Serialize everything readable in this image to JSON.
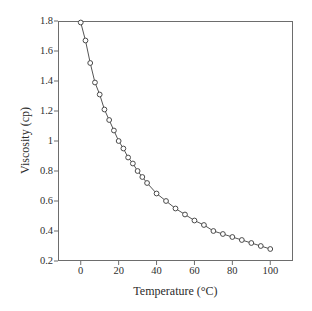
{
  "chart_data": {
    "type": "line",
    "title": "",
    "xlabel": "Temperature (°C)",
    "ylabel": "Viscosity (cp)",
    "xlim": [
      -12,
      112
    ],
    "ylim": [
      0.2,
      1.8
    ],
    "xticks": [
      0,
      20,
      40,
      60,
      80,
      100
    ],
    "xtick_labels": [
      "0",
      "20",
      "40",
      "60",
      "80",
      "100"
    ],
    "yticks": [
      0.2,
      0.4,
      0.6,
      0.8,
      1.0,
      1.2,
      1.4,
      1.6,
      1.8
    ],
    "ytick_labels": [
      "0.2",
      "0.4",
      "0.6",
      "0.8",
      "1",
      "1.2",
      "1.4",
      "1.6",
      "1.8"
    ],
    "grid": false,
    "legend": null,
    "marker": "open-circle",
    "line_color": "#555555",
    "marker_color": "#4a4a4a",
    "axis_color": "#6d6d6d",
    "background": "#ffffff",
    "series": [
      {
        "name": "Water viscosity",
        "x": [
          0,
          2.5,
          5,
          7.5,
          10,
          12.5,
          15,
          17.5,
          20,
          22.5,
          25,
          27.5,
          30,
          32.5,
          35,
          40,
          45,
          50,
          55,
          60,
          65,
          70,
          75,
          80,
          85,
          90,
          95,
          100
        ],
        "y": [
          1.79,
          1.67,
          1.52,
          1.39,
          1.31,
          1.21,
          1.14,
          1.07,
          1.0,
          0.95,
          0.89,
          0.85,
          0.8,
          0.76,
          0.72,
          0.65,
          0.6,
          0.55,
          0.51,
          0.47,
          0.44,
          0.4,
          0.38,
          0.36,
          0.34,
          0.32,
          0.3,
          0.28
        ]
      }
    ]
  },
  "figure": {
    "xaxis_title": "Temperature (°C)",
    "yaxis_title": "Viscosity (cp)"
  }
}
